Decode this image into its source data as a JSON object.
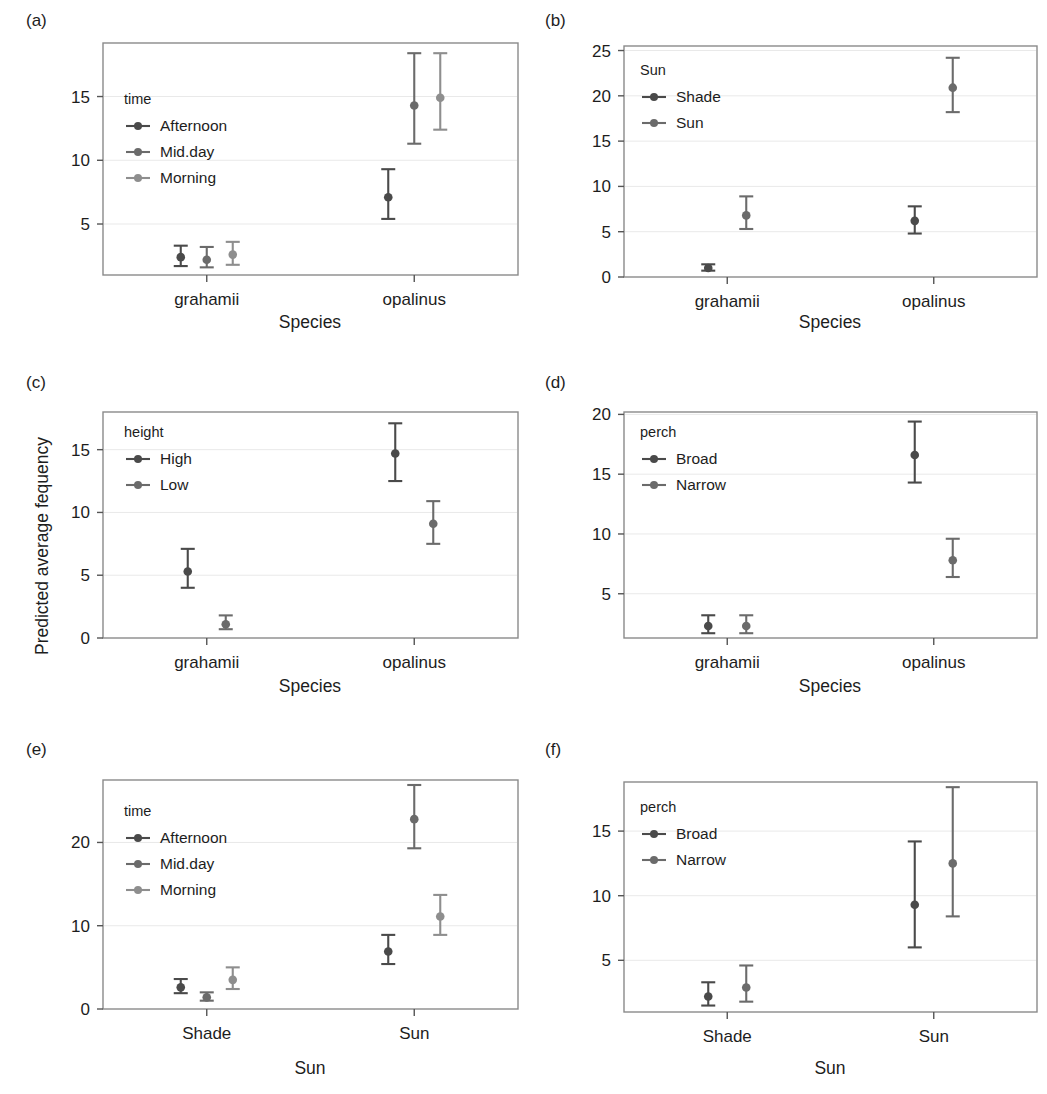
{
  "figure": {
    "ylabel": "Predicted average fequency",
    "series_colors": {
      "dark": "#4a4a4a",
      "medium": "#6b6b6b",
      "light": "#8e8e8e"
    },
    "frame_color": "#8a8a8a",
    "grid_color": "#e9e9e9"
  },
  "chart_data": [
    {
      "panel": "(a)",
      "type": "scatter",
      "title": "",
      "xlabel": "Species",
      "ylabel": "Predicted average fequency",
      "categories": [
        "grahamii",
        "opalinus"
      ],
      "ylim": [
        1.0,
        19.2
      ],
      "yticks": [
        5,
        10,
        15
      ],
      "ytick_labels": [
        "5",
        "10",
        "15"
      ],
      "grid": true,
      "legend": {
        "title": "time",
        "position": "top-left",
        "entries": [
          "Afternoon",
          "Mid.day",
          "Morning"
        ]
      },
      "series": [
        {
          "name": "Afternoon",
          "color": "#4a4a4a",
          "points": [
            {
              "category": "grahamii",
              "value": 2.4,
              "lower": 1.7,
              "upper": 3.3
            },
            {
              "category": "opalinus",
              "value": 7.1,
              "lower": 5.4,
              "upper": 9.3
            }
          ]
        },
        {
          "name": "Mid.day",
          "color": "#6b6b6b",
          "points": [
            {
              "category": "grahamii",
              "value": 2.2,
              "lower": 1.6,
              "upper": 3.2
            },
            {
              "category": "opalinus",
              "value": 14.3,
              "lower": 11.3,
              "upper": 18.4
            }
          ]
        },
        {
          "name": "Morning",
          "color": "#8e8e8e",
          "points": [
            {
              "category": "grahamii",
              "value": 2.6,
              "lower": 1.8,
              "upper": 3.6
            },
            {
              "category": "opalinus",
              "value": 14.9,
              "lower": 12.4,
              "upper": 18.4
            }
          ]
        }
      ]
    },
    {
      "panel": "(b)",
      "type": "scatter",
      "title": "",
      "xlabel": "Species",
      "ylabel": "Predicted average fequency",
      "categories": [
        "grahamii",
        "opalinus"
      ],
      "ylim": [
        0,
        25.5
      ],
      "yticks": [
        0,
        5,
        10,
        15,
        20,
        25
      ],
      "ytick_labels": [
        "0",
        "5",
        "10",
        "15",
        "20",
        "25"
      ],
      "grid": true,
      "legend": {
        "title": "Sun",
        "position": "top-left",
        "entries": [
          "Shade",
          "Sun"
        ]
      },
      "series": [
        {
          "name": "Shade",
          "color": "#4a4a4a",
          "points": [
            {
              "category": "grahamii",
              "value": 1.0,
              "lower": 0.7,
              "upper": 1.4
            },
            {
              "category": "opalinus",
              "value": 6.2,
              "lower": 4.8,
              "upper": 7.8
            }
          ]
        },
        {
          "name": "Sun",
          "color": "#6b6b6b",
          "points": [
            {
              "category": "grahamii",
              "value": 6.8,
              "lower": 5.3,
              "upper": 8.9
            },
            {
              "category": "opalinus",
              "value": 20.9,
              "lower": 18.2,
              "upper": 24.2
            }
          ]
        }
      ]
    },
    {
      "panel": "(c)",
      "type": "scatter",
      "title": "",
      "xlabel": "Species",
      "ylabel": "Predicted average fequency",
      "categories": [
        "grahamii",
        "opalinus"
      ],
      "ylim": [
        0,
        18.0
      ],
      "yticks": [
        0,
        5,
        10,
        15
      ],
      "ytick_labels": [
        "0",
        "5",
        "10",
        "15"
      ],
      "grid": true,
      "legend": {
        "title": "height",
        "position": "top-left",
        "entries": [
          "High",
          "Low"
        ]
      },
      "series": [
        {
          "name": "High",
          "color": "#4a4a4a",
          "points": [
            {
              "category": "grahamii",
              "value": 5.3,
              "lower": 4.0,
              "upper": 7.1
            },
            {
              "category": "opalinus",
              "value": 14.7,
              "lower": 12.5,
              "upper": 17.1
            }
          ]
        },
        {
          "name": "Low",
          "color": "#6b6b6b",
          "points": [
            {
              "category": "grahamii",
              "value": 1.1,
              "lower": 0.7,
              "upper": 1.8
            },
            {
              "category": "opalinus",
              "value": 9.1,
              "lower": 7.5,
              "upper": 10.9
            }
          ]
        }
      ]
    },
    {
      "panel": "(d)",
      "type": "scatter",
      "title": "",
      "xlabel": "Species",
      "ylabel": "Predicted average fequency",
      "categories": [
        "grahamii",
        "opalinus"
      ],
      "ylim": [
        1.3,
        20.2
      ],
      "yticks": [
        5,
        10,
        15,
        20
      ],
      "ytick_labels": [
        "5",
        "10",
        "15",
        "20"
      ],
      "grid": true,
      "legend": {
        "title": "perch",
        "position": "top-left",
        "entries": [
          "Broad",
          "Narrow"
        ]
      },
      "series": [
        {
          "name": "Broad",
          "color": "#4a4a4a",
          "points": [
            {
              "category": "grahamii",
              "value": 2.3,
              "lower": 1.7,
              "upper": 3.2
            },
            {
              "category": "opalinus",
              "value": 16.6,
              "lower": 14.3,
              "upper": 19.4
            }
          ]
        },
        {
          "name": "Narrow",
          "color": "#6b6b6b",
          "points": [
            {
              "category": "grahamii",
              "value": 2.3,
              "lower": 1.7,
              "upper": 3.2
            },
            {
              "category": "opalinus",
              "value": 7.8,
              "lower": 6.4,
              "upper": 9.6
            }
          ]
        }
      ]
    },
    {
      "panel": "(e)",
      "type": "scatter",
      "title": "",
      "xlabel": "Sun",
      "ylabel": "Predicted average fequency",
      "categories": [
        "Shade",
        "Sun"
      ],
      "ylim": [
        0,
        27.5
      ],
      "yticks": [
        0,
        10,
        20
      ],
      "ytick_labels": [
        "0",
        "10",
        "20"
      ],
      "grid": true,
      "legend": {
        "title": "time",
        "position": "top-left",
        "entries": [
          "Afternoon",
          "Mid.day",
          "Morning"
        ]
      },
      "series": [
        {
          "name": "Afternoon",
          "color": "#4a4a4a",
          "points": [
            {
              "category": "Shade",
              "value": 2.6,
              "lower": 1.9,
              "upper": 3.6
            },
            {
              "category": "Sun",
              "value": 6.9,
              "lower": 5.4,
              "upper": 8.9
            }
          ]
        },
        {
          "name": "Mid.day",
          "color": "#6b6b6b",
          "points": [
            {
              "category": "Shade",
              "value": 1.4,
              "lower": 1.0,
              "upper": 2.0
            },
            {
              "category": "Sun",
              "value": 22.8,
              "lower": 19.3,
              "upper": 26.9
            }
          ]
        },
        {
          "name": "Morning",
          "color": "#8e8e8e",
          "points": [
            {
              "category": "Shade",
              "value": 3.5,
              "lower": 2.4,
              "upper": 5.0
            },
            {
              "category": "Sun",
              "value": 11.1,
              "lower": 8.9,
              "upper": 13.7
            }
          ]
        }
      ]
    },
    {
      "panel": "(f)",
      "type": "scatter",
      "title": "",
      "xlabel": "Sun",
      "ylabel": "Predicted average fequency",
      "categories": [
        "Shade",
        "Sun"
      ],
      "ylim": [
        1.0,
        18.8
      ],
      "yticks": [
        5,
        10,
        15
      ],
      "ytick_labels": [
        "5",
        "10",
        "15"
      ],
      "grid": true,
      "legend": {
        "title": "perch",
        "position": "top-left",
        "entries": [
          "Broad",
          "Narrow"
        ]
      },
      "series": [
        {
          "name": "Broad",
          "color": "#4a4a4a",
          "points": [
            {
              "category": "Shade",
              "value": 2.2,
              "lower": 1.5,
              "upper": 3.3
            },
            {
              "category": "Sun",
              "value": 9.3,
              "lower": 6.0,
              "upper": 14.2
            }
          ]
        },
        {
          "name": "Narrow",
          "color": "#6b6b6b",
          "points": [
            {
              "category": "Shade",
              "value": 2.9,
              "lower": 1.8,
              "upper": 4.6
            },
            {
              "category": "Sun",
              "value": 12.5,
              "lower": 8.4,
              "upper": 18.4
            }
          ]
        }
      ]
    }
  ]
}
